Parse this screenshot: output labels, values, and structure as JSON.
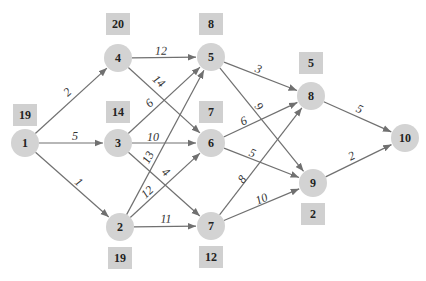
{
  "colors": {
    "node_fill": "#d3d3d3",
    "box_fill": "#d0d0d0",
    "edge": "#707070",
    "text": "#222222"
  },
  "nodes": [
    {
      "id": "1",
      "x": 25,
      "y": 143
    },
    {
      "id": "2",
      "x": 120,
      "y": 227
    },
    {
      "id": "3",
      "x": 118,
      "y": 143
    },
    {
      "id": "4",
      "x": 118,
      "y": 58
    },
    {
      "id": "5",
      "x": 211,
      "y": 57
    },
    {
      "id": "6",
      "x": 211,
      "y": 143
    },
    {
      "id": "7",
      "x": 211,
      "y": 226
    },
    {
      "id": "8",
      "x": 311,
      "y": 96
    },
    {
      "id": "9",
      "x": 313,
      "y": 183
    },
    {
      "id": "10",
      "x": 405,
      "y": 138
    }
  ],
  "boxes": [
    {
      "node": "1",
      "value": "19",
      "x": 25,
      "y": 115
    },
    {
      "node": "4",
      "value": "20",
      "x": 118,
      "y": 24
    },
    {
      "node": "5",
      "value": "8",
      "x": 211,
      "y": 24
    },
    {
      "node": "3",
      "value": "14",
      "x": 118,
      "y": 112
    },
    {
      "node": "6",
      "value": "7",
      "x": 211,
      "y": 112
    },
    {
      "node": "8",
      "value": "5",
      "x": 311,
      "y": 63
    },
    {
      "node": "9",
      "value": "2",
      "x": 313,
      "y": 214
    },
    {
      "node": "2",
      "value": "19",
      "x": 120,
      "y": 258
    },
    {
      "node": "7",
      "value": "12",
      "x": 211,
      "y": 257
    }
  ],
  "edges": [
    {
      "from": "1",
      "to": "4",
      "weight": "2",
      "lx": 68,
      "ly": 93
    },
    {
      "from": "1",
      "to": "3",
      "weight": "5",
      "lx": 75,
      "ly": 137
    },
    {
      "from": "1",
      "to": "2",
      "weight": "1",
      "lx": 78,
      "ly": 183
    },
    {
      "from": "4",
      "to": "5",
      "weight": "12",
      "lx": 161,
      "ly": 52
    },
    {
      "from": "4",
      "to": "6",
      "weight": "14",
      "lx": 158,
      "ly": 82
    },
    {
      "from": "3",
      "to": "5",
      "weight": "6",
      "lx": 150,
      "ly": 104
    },
    {
      "from": "3",
      "to": "6",
      "weight": "10",
      "lx": 153,
      "ly": 138
    },
    {
      "from": "3",
      "to": "7",
      "weight": "4",
      "lx": 165,
      "ly": 173
    },
    {
      "from": "2",
      "to": "5",
      "weight": "13",
      "lx": 149,
      "ly": 158
    },
    {
      "from": "2",
      "to": "6",
      "weight": "12",
      "lx": 148,
      "ly": 193
    },
    {
      "from": "2",
      "to": "7",
      "weight": "11",
      "lx": 166,
      "ly": 220
    },
    {
      "from": "5",
      "to": "8",
      "weight": "3",
      "lx": 258,
      "ly": 70
    },
    {
      "from": "5",
      "to": "9",
      "weight": "9",
      "lx": 258,
      "ly": 107
    },
    {
      "from": "6",
      "to": "8",
      "weight": "6",
      "lx": 244,
      "ly": 122
    },
    {
      "from": "6",
      "to": "9",
      "weight": "5",
      "lx": 252,
      "ly": 154
    },
    {
      "from": "7",
      "to": "8",
      "weight": "8",
      "lx": 243,
      "ly": 180
    },
    {
      "from": "7",
      "to": "9",
      "weight": "10",
      "lx": 262,
      "ly": 200
    },
    {
      "from": "8",
      "to": "10",
      "weight": "5",
      "lx": 359,
      "ly": 110
    },
    {
      "from": "9",
      "to": "10",
      "weight": "2",
      "lx": 352,
      "ly": 157
    }
  ]
}
